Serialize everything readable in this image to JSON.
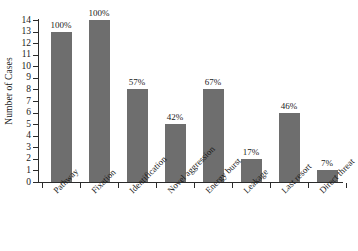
{
  "chart_data": {
    "type": "bar",
    "title": "",
    "xlabel": "",
    "ylabel": "Number of Cases",
    "ylim": [
      0,
      14
    ],
    "grid": false,
    "legend": false,
    "bar_color": "#6e6e6e",
    "axis_color": "#2b2b2b",
    "categories": [
      "Pathway",
      "Fixation",
      "Identification",
      "Novel aggression",
      "Energy burst",
      "Leakage",
      "Last resort",
      "Direct threat"
    ],
    "values": [
      13,
      14,
      8,
      5,
      8,
      2,
      6,
      1
    ],
    "data_labels": [
      "100%",
      "100%",
      "57%",
      "42%",
      "67%",
      "17%",
      "46%",
      "7%"
    ],
    "yticks": [
      0,
      1,
      2,
      3,
      4,
      5,
      6,
      7,
      8,
      9,
      10,
      11,
      12,
      13,
      14
    ],
    "ytick_labels": [
      "0",
      "1",
      "2",
      "3",
      "4",
      "5",
      "6",
      "7",
      "8",
      "9",
      "10",
      "11",
      "12",
      "13",
      "14"
    ]
  }
}
